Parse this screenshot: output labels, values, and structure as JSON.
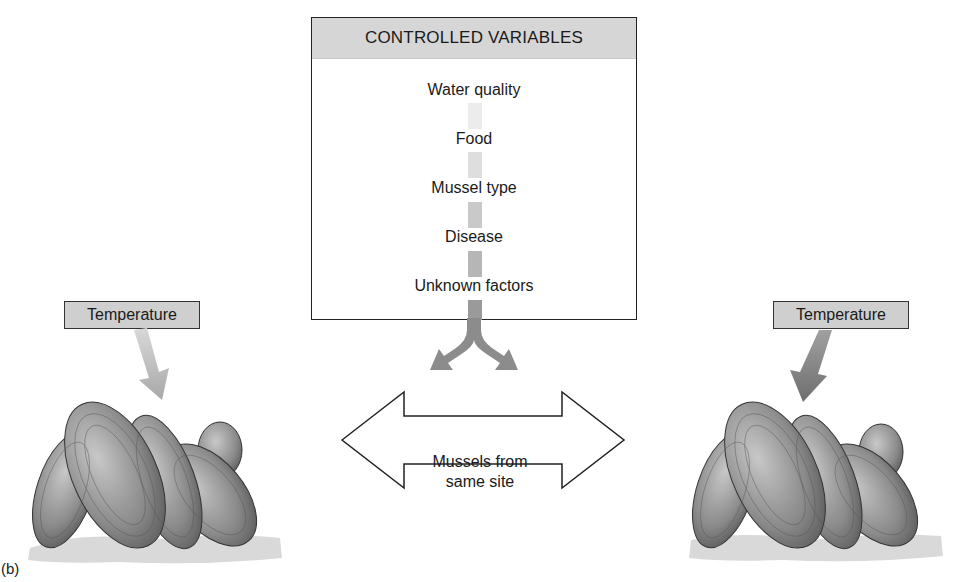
{
  "figure": {
    "panel_label": "(b)",
    "controlled_variables": {
      "header": "CONTROLLED VARIABLES",
      "items": [
        "Water quality",
        "Food",
        "Mussel type",
        "Disease",
        "Unknown factors"
      ]
    },
    "left_group": {
      "label": "Temperature"
    },
    "right_group": {
      "label": "Temperature"
    },
    "center_arrow": {
      "line1": "Mussels from",
      "line2": "same site"
    },
    "colors": {
      "header_fill": "#d6d6d6",
      "label_fill": "#cfcfcf",
      "arrow_gray": "#8c8c8c",
      "left_arrow_gray": "#b0b0b0",
      "right_arrow_gray": "#808080",
      "border": "#222222"
    }
  }
}
